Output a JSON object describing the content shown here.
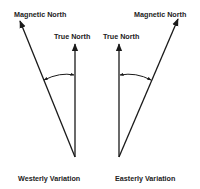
{
  "diagram": {
    "left_panel": {
      "magnetic_label": "Magnetic North",
      "true_label": "True North",
      "caption": "Westerly Variation"
    },
    "right_panel": {
      "magnetic_label": "Magnetic North",
      "true_label": "True North",
      "caption": "Easterly Variation"
    }
  }
}
